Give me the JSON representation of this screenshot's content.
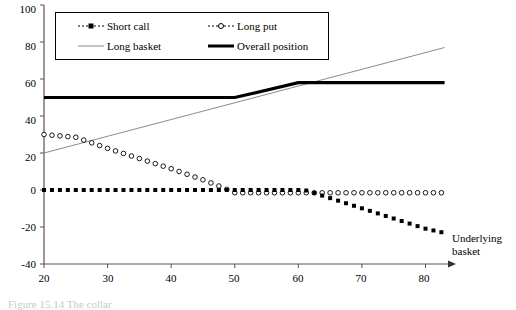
{
  "figure": {
    "caption": "Figure 15.14  The collar"
  },
  "chart_data": {
    "type": "line",
    "title": "",
    "xlabel": "Underlying basket",
    "ylabel": "",
    "xlim": [
      20,
      85
    ],
    "ylim": [
      -40,
      100
    ],
    "xticks": [
      20,
      30,
      40,
      50,
      60,
      70,
      80
    ],
    "xtick_labels": [
      "20",
      "30",
      "40",
      "50",
      "60",
      "70",
      "80"
    ],
    "yticks": [
      -40,
      -20,
      0,
      20,
      40,
      60,
      80,
      100
    ],
    "ytick_labels": [
      "-40",
      "-20",
      "0",
      "20",
      "40",
      "60",
      "80",
      "100"
    ],
    "grid": false,
    "legend_position": "top-inside",
    "series": [
      {
        "name": "Short call",
        "style": "dotted-filled-square",
        "color": "#000000",
        "x": [
          20,
          25,
          30,
          35,
          40,
          45,
          50,
          55,
          60,
          61,
          65,
          70,
          75,
          80,
          83
        ],
        "values": [
          0,
          0,
          0,
          0,
          0,
          0,
          0,
          0,
          0,
          0,
          -4.4,
          -9.9,
          -15.4,
          -20.9,
          -23.2
        ]
      },
      {
        "name": "Long put",
        "style": "open-circle-markers",
        "color": "#000000",
        "x": [
          20,
          25,
          30,
          35,
          40,
          45,
          48,
          50,
          55,
          60,
          65,
          70,
          75,
          80,
          83
        ],
        "values": [
          30,
          28.5,
          22.5,
          17,
          11.5,
          5.5,
          1.5,
          -1.5,
          -1.5,
          -1.5,
          -1.5,
          -1.5,
          -1.5,
          -1.5,
          -1.5
        ]
      },
      {
        "name": "Long basket",
        "style": "thin-line",
        "color": "#8a8a8a",
        "x": [
          20,
          83
        ],
        "values": [
          20,
          77
        ]
      },
      {
        "name": "Overall position",
        "style": "thick-line",
        "color": "#000000",
        "x": [
          20,
          50,
          60,
          83
        ],
        "values": [
          50,
          50,
          58,
          58
        ]
      }
    ]
  },
  "legend": {
    "items": [
      {
        "label": "Short call",
        "swatch": "dotted-square-swatch"
      },
      {
        "label": "Long put",
        "swatch": "open-circle-swatch"
      },
      {
        "label": "Long basket",
        "swatch": "thin-gray-line-swatch"
      },
      {
        "label": "Overall position",
        "swatch": "thick-black-line-swatch"
      }
    ]
  },
  "axis": {
    "x_axis_title": "Underlying",
    "x_axis_title2": "basket"
  }
}
